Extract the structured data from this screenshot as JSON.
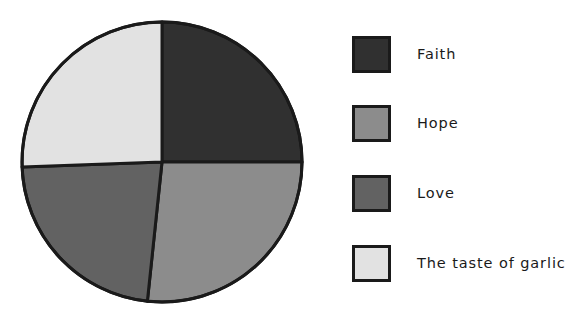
{
  "chart_data": {
    "type": "pie",
    "title": "",
    "subtitle": "",
    "xlabel": "",
    "ylabel": "",
    "grid": false,
    "legend_position": "right",
    "start_angle_deg": 90,
    "direction": "clockwise",
    "categories": [
      "Faith",
      "Hope",
      "Love",
      "The taste of garlic"
    ],
    "values": [
      25.0,
      26.7,
      22.8,
      25.5
    ],
    "slices": [
      {
        "label": "Faith",
        "value": 25.0,
        "angle_deg": 90,
        "color": "#303030",
        "start_deg": 90,
        "end_deg": 0
      },
      {
        "label": "Hope",
        "value": 26.7,
        "angle_deg": 96,
        "color": "#8c8c8c",
        "start_deg": 0,
        "end_deg": -96
      },
      {
        "label": "Love",
        "value": 22.8,
        "angle_deg": 82,
        "color": "#626262",
        "start_deg": -96,
        "end_deg": -178
      },
      {
        "label": "The taste of garlic",
        "value": 25.5,
        "angle_deg": 92,
        "color": "#e2e2e2",
        "start_deg": -178,
        "end_deg": -270
      }
    ],
    "edge_color": "#1a1a1a",
    "background_color": "#ffffff",
    "annotations": []
  },
  "pie": {
    "center_x": 162,
    "center_y": 162,
    "radius": 140,
    "outline_color": "#1a1a1a",
    "outline_width": 3
  },
  "legend": {
    "entries": [
      {
        "label": "Faith",
        "color": "#303030",
        "swatch_name": "legend-swatch-faith"
      },
      {
        "label": "Hope",
        "color": "#8c8c8c",
        "swatch_name": "legend-swatch-hope"
      },
      {
        "label": "Love",
        "color": "#626262",
        "swatch_name": "legend-swatch-love"
      },
      {
        "label": "The taste of garlic",
        "color": "#e2e2e2",
        "swatch_name": "legend-swatch-garlic"
      }
    ]
  },
  "colors": {
    "faith": "#303030",
    "hope": "#8c8c8c",
    "love": "#626262",
    "garlic": "#e2e2e2",
    "edge": "#1a1a1a",
    "background": "#ffffff"
  }
}
